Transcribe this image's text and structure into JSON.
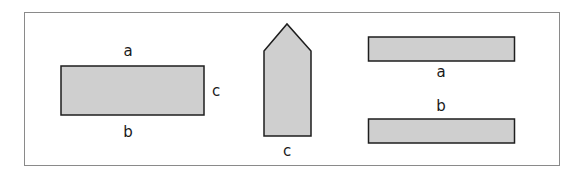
{
  "figure": {
    "frame_color": "#8a8a8a",
    "shape_fill": "#cfcfcf",
    "shape_stroke": "#1e1e1e",
    "shapes": [
      {
        "id": "rectangle",
        "labels": {
          "top": "a",
          "right": "c",
          "bottom": "b"
        }
      },
      {
        "id": "pentagon-house",
        "labels": {
          "bottom": "c"
        }
      },
      {
        "id": "strip-a",
        "label": "a"
      },
      {
        "id": "strip-b",
        "label": "b"
      }
    ]
  }
}
